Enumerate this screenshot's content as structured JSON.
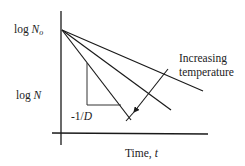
{
  "diagram": {
    "type": "first-order inactivation kinetics",
    "y_axis": {
      "label_top": {
        "prefix": "log ",
        "var": "N",
        "sub": "o"
      },
      "label_mid": {
        "prefix": "log ",
        "var": "N"
      }
    },
    "x_axis": {
      "label": {
        "prefix": "Time, ",
        "var": "t"
      }
    },
    "slope_label": {
      "prefix": "-1/",
      "var": "D"
    },
    "annotation": {
      "line1": "Increasing",
      "line2": "temperature"
    },
    "lines": [
      {
        "name": "low-temperature-line",
        "from": [
          62,
          30
        ],
        "to": [
          203,
          91
        ]
      },
      {
        "name": "mid-temperature-line",
        "from": [
          62,
          30
        ],
        "to": [
          171,
          110
        ]
      },
      {
        "name": "high-temperature-line",
        "from": [
          62,
          30
        ],
        "to": [
          131,
          120
        ]
      }
    ],
    "colors": {
      "stroke": "#1a1a1a",
      "background": "#ffffff"
    }
  }
}
